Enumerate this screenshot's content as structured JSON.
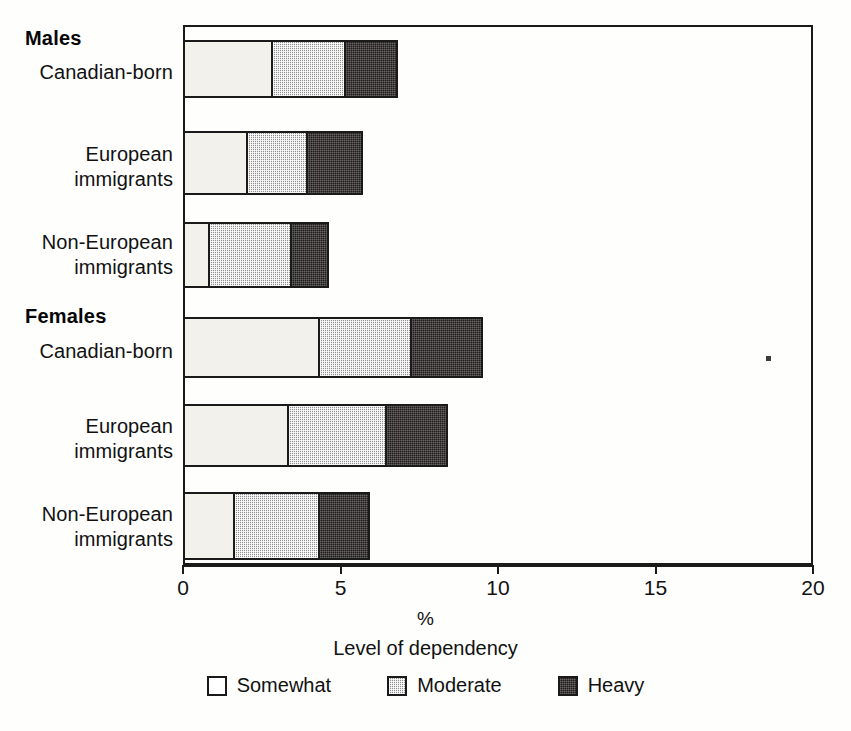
{
  "chart_data": {
    "type": "bar",
    "orientation": "horizontal",
    "stacked": true,
    "title": "",
    "xlabel": "%",
    "axis_title": "Level of dependency",
    "ylabel": "",
    "xlim": [
      0,
      20
    ],
    "xticks": [
      0,
      5,
      10,
      15,
      20
    ],
    "xtick_labels": [
      "0",
      "5",
      "10",
      "15",
      "20"
    ],
    "grid": false,
    "legend_position": "bottom-center",
    "groups": [
      {
        "name": "Males",
        "categories": [
          "Canadian-born",
          "European\nimmigrants",
          "Non-European\nimmigrants"
        ]
      },
      {
        "name": "Females",
        "categories": [
          "Canadian-born",
          "European\nimmigrants",
          "Non-European\nimmigrants"
        ]
      }
    ],
    "categories": [
      "Males: Canadian-born",
      "Males: European immigrants",
      "Males: Non-European immigrants",
      "Females: Canadian-born",
      "Females: European immigrants",
      "Females: Non-European immigrants"
    ],
    "series": [
      {
        "name": "Somewhat",
        "color": "#f2f1ec",
        "values": [
          2.8,
          2.0,
          0.8,
          4.3,
          3.3,
          1.6
        ]
      },
      {
        "name": "Moderate",
        "color": "#8e8e8e",
        "values": [
          2.3,
          1.9,
          2.6,
          2.9,
          3.1,
          2.7
        ]
      },
      {
        "name": "Heavy",
        "color": "#211d1d",
        "values": [
          1.6,
          1.7,
          1.1,
          2.2,
          1.9,
          1.5
        ]
      }
    ],
    "totals": [
      6.7,
      5.6,
      4.5,
      9.4,
      8.3,
      5.8
    ]
  },
  "labels": {
    "group_males": "Males",
    "group_females": "Females",
    "cat_canadian_born": "Canadian-born",
    "cat_european": "European\nimmigrants",
    "cat_non_european": "Non-European\nimmigrants"
  },
  "axis": {
    "ticks": [
      "0",
      "5",
      "10",
      "15",
      "20"
    ],
    "unit": "%",
    "title": "Level of dependency"
  },
  "legend": {
    "items": [
      {
        "label": "Somewhat"
      },
      {
        "label": "Moderate"
      },
      {
        "label": "Heavy"
      }
    ]
  }
}
